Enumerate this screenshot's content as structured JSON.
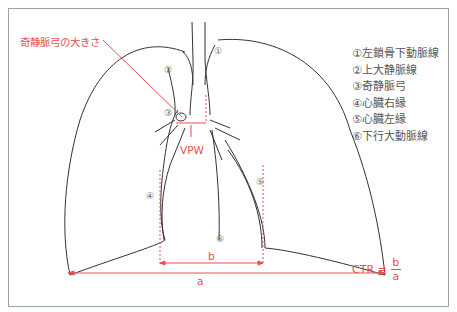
{
  "title_label": "奇静脈弓の大きさ",
  "vpw_label": "VPW",
  "legend": [
    {
      "num": "①",
      "text": "左鎖骨下動脈線"
    },
    {
      "num": "②",
      "text": "上大静脈線"
    },
    {
      "num": "③",
      "text": "奇静脈弓"
    },
    {
      "num": "④",
      "text": "心臓右縁"
    },
    {
      "num": "⑤",
      "text": "心臓左縁"
    },
    {
      "num": "⑥",
      "text": "下行大動脈線"
    }
  ],
  "markers": {
    "m1": "①",
    "m2": "②",
    "m3": "③",
    "m4": "④",
    "m5": "⑤",
    "m6": "⑥"
  },
  "measure": {
    "a": "a",
    "b": "b"
  },
  "ctr": {
    "label": "CTR =",
    "numerator": "b",
    "denominator": "a"
  },
  "colors": {
    "accent": "#e8504f",
    "line": "#333333",
    "frame": "#9aa89a"
  }
}
